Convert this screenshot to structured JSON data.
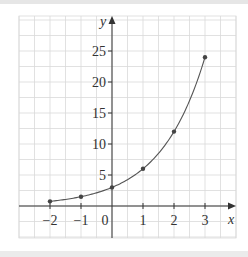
{
  "chart_data": {
    "type": "line",
    "title": "",
    "xlabel": "x",
    "ylabel": "y",
    "x": [
      -2,
      -1,
      0,
      1,
      2,
      3
    ],
    "values": [
      0.75,
      1.5,
      3,
      6,
      12,
      24
    ],
    "series": [
      {
        "name": "y = 3·2^x",
        "x": [
          -2,
          -1,
          0,
          1,
          2,
          3
        ],
        "values": [
          0.75,
          1.5,
          3,
          6,
          12,
          24
        ],
        "markers": true,
        "smooth": true
      }
    ],
    "xticks": [
      "−2",
      "−1",
      "0",
      "1",
      "2",
      "3"
    ],
    "yticks": [
      "5",
      "10",
      "15",
      "20",
      "25"
    ],
    "xlim": [
      -3,
      4
    ],
    "ylim": [
      -5,
      30
    ],
    "grid": true,
    "legend": null
  },
  "axes": {
    "x_label": "x",
    "y_label": "y",
    "origin_label": "0"
  },
  "colors": {
    "grid": "#d9d9d9",
    "axis": "#333333",
    "curve": "#555555",
    "marker": "#444444",
    "frame_band": "#e6e6e6"
  }
}
